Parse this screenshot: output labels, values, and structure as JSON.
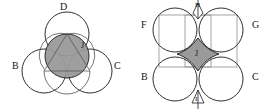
{
  "figure": {
    "background_color": "#ffffff",
    "stroke_color": "#1a1a1a",
    "fill_gray": "#9a9a9a",
    "thin_gray": "#8e8e8e"
  },
  "left_diagram": {
    "name": "three-circle-packing",
    "outer_circles": [
      {
        "label": "D",
        "position": "top"
      },
      {
        "label": "B",
        "position": "bottom-left"
      },
      {
        "label": "C",
        "position": "bottom-right"
      }
    ],
    "center_shape": {
      "label": "J",
      "fill": "#9a9a9a",
      "kind": "circle"
    },
    "inscribed": {
      "kind": "triangle"
    }
  },
  "right_diagram": {
    "name": "four-circle-packing",
    "outer_circles": [
      {
        "label": "F",
        "position": "top-left"
      },
      {
        "label": "G",
        "position": "top-right"
      },
      {
        "label": "B",
        "position": "bottom-left"
      },
      {
        "label": "C",
        "position": "bottom-right"
      }
    ],
    "center_shape": {
      "label": "J",
      "fill": "#9a9a9a",
      "kind": "curved-hexagon"
    },
    "gap_shapes": [
      {
        "label": "H",
        "position": "top-gap"
      },
      {
        "label": "I",
        "position": "bottom-gap"
      }
    ],
    "square_outline": {
      "kind": "square",
      "color": "#8e8e8e"
    }
  }
}
